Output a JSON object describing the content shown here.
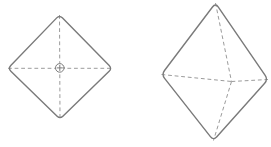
{
  "figure": {
    "background_color": "#ffffff",
    "outline_color": "#7a7a7a",
    "dash_color": "#9b9b9b",
    "outline_width": 1.4,
    "dash_width": 1,
    "dash_pattern": "3.8 2.8",
    "width": 271,
    "height": 147,
    "shapes": [
      {
        "name": "octahedron-top-view",
        "outline": [
          [
            59.5,
            15
          ],
          [
            112,
            68.4
          ],
          [
            60,
            119
          ],
          [
            8,
            68.4
          ]
        ],
        "corner_radius": 4,
        "dashed_lines": [
          [
            [
              8,
              68.3
            ],
            [
              112,
              68.3
            ]
          ],
          [
            [
              59.5,
              15
            ],
            [
              60,
              119
            ]
          ]
        ],
        "center_symbol": {
          "cx": 59.8,
          "cy": 67.9,
          "r": 4.3,
          "cross_arm": 2.6
        }
      },
      {
        "name": "octahedron-perspective-view",
        "outline": [
          [
            215.5,
            3
          ],
          [
            268,
            79.5
          ],
          [
            213.5,
            140.5
          ],
          [
            161.5,
            74.5
          ]
        ],
        "corner_radius": 5,
        "back_vertex": [
          231.5,
          81.5
        ],
        "dashed_lines": [
          [
            [
              215.5,
              3
            ],
            [
              231.5,
              81.5
            ]
          ],
          [
            [
              161.5,
              74.5
            ],
            [
              231.5,
              81.5
            ]
          ],
          [
            [
              231.5,
              81.5
            ],
            [
              268,
              79.5
            ]
          ],
          [
            [
              231.5,
              81.5
            ],
            [
              213.5,
              140.5
            ]
          ]
        ]
      }
    ]
  }
}
